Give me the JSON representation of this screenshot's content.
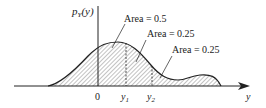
{
  "diagram": {
    "ylabel": "p",
    "ylabel_sub": "Y",
    "ylabel_arg": "(y)",
    "xlabel": "y",
    "ticks": {
      "zero": "0",
      "y1": "y",
      "y1_sub": "1",
      "y2": "y",
      "y2_sub": "2"
    },
    "annotations": [
      {
        "label": "Area = 0.5"
      },
      {
        "label": "Area = 0.25"
      },
      {
        "label": "Area = 0.25"
      }
    ],
    "colors": {
      "line": "#222222",
      "hatch": "#555555",
      "background": "#ffffff"
    }
  }
}
